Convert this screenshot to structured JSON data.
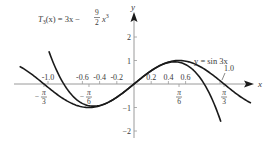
{
  "chart_data": {
    "type": "line",
    "title": "",
    "xlabel": "x",
    "ylabel": "y",
    "xlim": [
      -1.38,
      1.38
    ],
    "ylim": [
      -2.3,
      2.9
    ],
    "grid": false,
    "x_ticks": [
      {
        "value": -1.0,
        "label": "-1.0"
      },
      {
        "value": -0.6,
        "label": "-0.6"
      },
      {
        "value": -0.4,
        "label": "-0.4"
      },
      {
        "value": -0.2,
        "label": "-0.2"
      },
      {
        "value": 0.2,
        "label": "0.2"
      },
      {
        "value": 0.4,
        "label": "0.4"
      },
      {
        "value": 0.6,
        "label": "0.6"
      },
      {
        "value": 1.0,
        "label": "1.0"
      }
    ],
    "x_pi_ticks": [
      {
        "value": -1.0472,
        "label_num": "π",
        "label_den": "3",
        "sign": "−"
      },
      {
        "value": -0.5236,
        "label_num": "π",
        "label_den": "6",
        "sign": "−"
      },
      {
        "value": 0.5236,
        "label_num": "π",
        "label_den": "6",
        "sign": ""
      },
      {
        "value": 1.0472,
        "label_num": "π",
        "label_den": "3",
        "sign": ""
      }
    ],
    "y_ticks": [
      {
        "value": 2,
        "label": "2"
      },
      {
        "value": 1,
        "label": "1"
      },
      {
        "value": -1,
        "label": "−1"
      },
      {
        "value": -2,
        "label": "−2"
      }
    ],
    "series": [
      {
        "name": "y = sin 3x",
        "formula": "sin(3x)",
        "x_range": [
          -1.33,
          1.36
        ],
        "points": [
          [
            -1.0472,
            0
          ],
          [
            -0.5236,
            -1
          ],
          [
            0,
            0
          ],
          [
            0.5236,
            1
          ],
          [
            1.0472,
            0
          ]
        ]
      },
      {
        "name": "T3(x) = 3x − (9/2)x³",
        "formula": "3x - 4.5x^3",
        "x_range": [
          -0.99,
          1.01
        ],
        "points": [
          [
            -0.8165,
            0
          ],
          [
            -0.4714,
            -0.943
          ],
          [
            0,
            0
          ],
          [
            0.4714,
            0.943
          ],
          [
            0.8165,
            0
          ]
        ]
      }
    ],
    "annotations": [
      {
        "text_main": "T",
        "text_sub": "3",
        "text_rest": "(x) = 3x − ",
        "frac_num": "9",
        "frac_den": "2",
        "text_tail": "x",
        "text_sup": "3"
      },
      {
        "text": "y = sin 3x"
      },
      {
        "text": "1.0"
      }
    ]
  },
  "labels": {
    "x_axis": "x",
    "y_axis": "y",
    "sin_label": "y = sin 3x",
    "t3_T": "T",
    "t3_sub": "3",
    "t3_mid": "(x) = 3x − ",
    "t3_num": "9",
    "t3_den": "2",
    "t3_x": "x",
    "t3_sup": "3",
    "one_label": "1.0"
  },
  "colors": {
    "axis": "#9a9a9a",
    "curve": "#1a1a1a",
    "text": "#3a3a3a"
  }
}
